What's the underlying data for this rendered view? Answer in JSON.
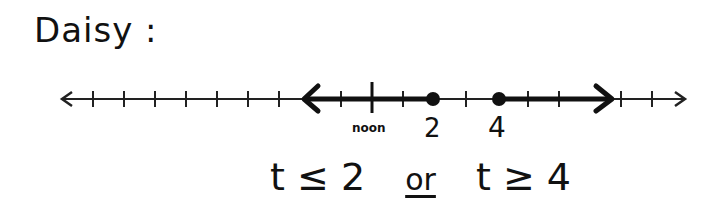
{
  "title": "Daisy :",
  "number_line": {
    "tick_labels": {
      "noon": "noon",
      "two": "2",
      "four": "4"
    },
    "closed_points": [
      2,
      4
    ],
    "shaded_left_ray_to": 2,
    "shaded_right_ray_from": 4,
    "tick_spacing_px": 31,
    "colors": {
      "ink": "#111111",
      "background": "#ffffff"
    }
  },
  "solution": {
    "left": "t ≤ 2",
    "connector": "or",
    "right": "t ≥ 4"
  }
}
